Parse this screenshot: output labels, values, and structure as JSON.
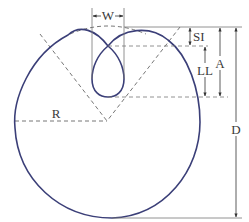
{
  "diagram": {
    "type": "geometric-dimension-drawing",
    "labels": {
      "width": "W",
      "slot_inset": "SI",
      "loop_length": "LL",
      "depth_a": "A",
      "diameter": "D",
      "radius": "R"
    },
    "colors": {
      "profile_stroke": "#3b3f78",
      "dimension_stroke": "#555555",
      "text": "#3a3a3a",
      "background": "#ffffff"
    }
  }
}
